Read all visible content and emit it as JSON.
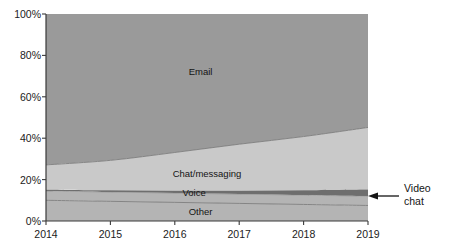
{
  "chart_data": {
    "type": "area",
    "stacked": true,
    "title": "",
    "subtitle": "",
    "xlabel": "",
    "ylabel": "",
    "x": [
      2014,
      2015,
      2016,
      2017,
      2018,
      2019
    ],
    "categories": [
      "2014",
      "2015",
      "2016",
      "2017",
      "2018",
      "2019"
    ],
    "xlim": [
      2014,
      2019
    ],
    "ylim": [
      0,
      100
    ],
    "y_tick_labels": [
      "0%",
      "20%",
      "40%",
      "60%",
      "80%",
      "100%"
    ],
    "y_ticks": [
      0,
      20,
      40,
      60,
      80,
      100
    ],
    "x_tick_labels": [
      "2014",
      "2015",
      "2016",
      "2017",
      "2018",
      "2019"
    ],
    "grid": false,
    "legend": "in-plot labels",
    "units": "percent",
    "series": [
      {
        "name": "Other",
        "values": [
          10,
          9.5,
          9,
          8.5,
          8,
          7.5
        ],
        "color": "#b4b4b4",
        "label_x": 2016.4,
        "label_y": 4.5
      },
      {
        "name": "Voice",
        "values": [
          4.5,
          4.5,
          4.5,
          4.5,
          4.5,
          4.5
        ],
        "color": "#b4b4b4",
        "label_x": 2016.3,
        "label_y": 13.5
      },
      {
        "name": "Video chat",
        "values": [
          0.6,
          0.8,
          1.1,
          1.6,
          2.3,
          3.2
        ],
        "color": "#6e6e6e",
        "label_x": 2019,
        "label_y": 13.5
      },
      {
        "name": "Chat/messaging",
        "values": [
          12,
          14.5,
          18.5,
          22.5,
          26,
          30
        ],
        "color": "#c9c9c9",
        "label_x": 2016.5,
        "label_y": 23
      },
      {
        "name": "Email",
        "values": [
          72.9,
          70.7,
          66.9,
          62.9,
          59.2,
          54.8
        ],
        "color": "#9a9a9a",
        "label_x": 2016.4,
        "label_y": 72
      }
    ],
    "boundaries_percent": {
      "other_top": [
        10,
        9.5,
        9,
        8.5,
        8,
        7.5
      ],
      "voice_top": [
        14.5,
        14,
        13.5,
        13,
        12.5,
        12
      ],
      "videochat_top": [
        15.1,
        14.8,
        14.6,
        14.6,
        14.8,
        15.2
      ],
      "chat_top": [
        27.1,
        29.3,
        33.1,
        37.1,
        40.8,
        45.2
      ],
      "email_top": [
        100,
        100,
        100,
        100,
        100,
        100
      ]
    },
    "annotations": [
      {
        "name": "video-chat-callout",
        "text_line_1": "Video",
        "text_line_2": "chat",
        "points_to_series": "Video chat",
        "points_to_x": 2019,
        "arrow": "left"
      }
    ]
  },
  "axis": {
    "y_labels": [
      "100%",
      "80%",
      "60%",
      "40%",
      "20%",
      "0%"
    ],
    "x_labels": [
      "2014",
      "2015",
      "2016",
      "2017",
      "2018",
      "2019"
    ]
  },
  "labels": {
    "email": "Email",
    "chat_messaging": "Chat/messaging",
    "voice": "Voice",
    "other": "Other",
    "video_chat_line1": "Video",
    "video_chat_line2": "chat"
  },
  "colors": {
    "email": "#9a9a9a",
    "chat": "#c9c9c9",
    "voice": "#b4b4b4",
    "video_chat": "#6e6e6e",
    "other": "#b4b4b4",
    "axis": "#3a3a3a",
    "boundary_line": "#7d7d7d",
    "text": "#141414",
    "background": "#ffffff"
  }
}
